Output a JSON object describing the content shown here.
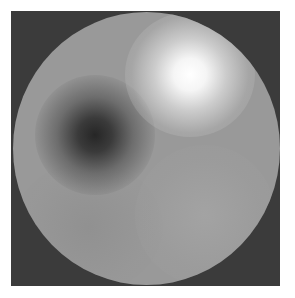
{
  "figure": {
    "type": "circular-intensity-map",
    "background_color": "#ffffff",
    "frame_color": "#3b3b3b",
    "disc_color": "#999999",
    "features": [
      {
        "name": "bright-spot",
        "center": [
          190,
          72
        ],
        "radius": 55,
        "peak_color": "#ffffff"
      },
      {
        "name": "dark-spot",
        "center": [
          95,
          135
        ],
        "radius": 55,
        "peak_color": "#262626"
      },
      {
        "name": "soft-light-region",
        "center": [
          205,
          215
        ],
        "radius": 70,
        "peak_color": "#afafaf"
      }
    ]
  }
}
